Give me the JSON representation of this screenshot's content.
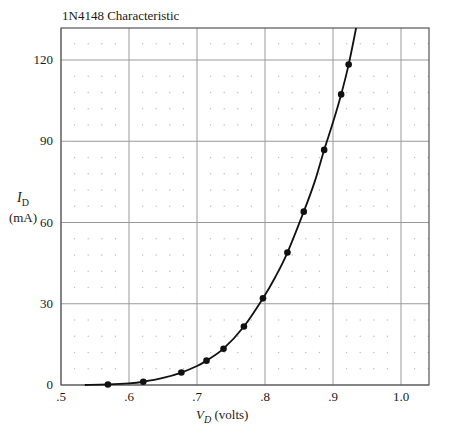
{
  "chart_data": {
    "type": "line",
    "title": "1N4148 Characteristic",
    "xlabel": "V_D (volts)",
    "xlabel_symbol": "V",
    "xlabel_sub": "D",
    "xlabel_unit": "(volts)",
    "ylabel": "I_D (mA)",
    "ylabel_symbol": "I",
    "ylabel_sub": "D",
    "ylabel_unit": "(mA)",
    "xlim": [
      0.5,
      1.04
    ],
    "ylim": [
      0,
      132
    ],
    "x_ticks": [
      0.5,
      0.6,
      0.7,
      0.8,
      0.9,
      1.0
    ],
    "x_tick_labels": [
      ".5",
      ".6",
      ".7",
      ".8",
      ".9",
      "1.0"
    ],
    "y_ticks": [
      0,
      30,
      60,
      90,
      120
    ],
    "y_tick_labels": [
      "0",
      "30",
      "60",
      "90",
      "120"
    ],
    "grid": {
      "major": true,
      "minor_dots": true,
      "minor_x_step": 0.02,
      "minor_y_step": 6
    },
    "legend": null,
    "series": [
      {
        "name": "Measured",
        "marker": "circle",
        "line": false,
        "points": [
          [
            0.569,
            0.2
          ],
          [
            0.621,
            1.2
          ],
          [
            0.677,
            4.6
          ],
          [
            0.714,
            9.0
          ],
          [
            0.739,
            13.4
          ],
          [
            0.769,
            21.6
          ],
          [
            0.797,
            32.0
          ],
          [
            0.833,
            48.9
          ],
          [
            0.857,
            64.0
          ],
          [
            0.887,
            86.8
          ],
          [
            0.912,
            107.3
          ],
          [
            0.923,
            118.3
          ]
        ]
      },
      {
        "name": "Fitted curve",
        "marker": "none",
        "line": true,
        "points": [
          [
            0.535,
            0.0
          ],
          [
            0.569,
            0.2
          ],
          [
            0.6,
            0.6
          ],
          [
            0.621,
            1.2
          ],
          [
            0.65,
            2.6
          ],
          [
            0.677,
            4.6
          ],
          [
            0.7,
            7.0
          ],
          [
            0.714,
            9.0
          ],
          [
            0.739,
            13.4
          ],
          [
            0.769,
            21.6
          ],
          [
            0.797,
            32.0
          ],
          [
            0.815,
            39.8
          ],
          [
            0.833,
            48.9
          ],
          [
            0.857,
            64.0
          ],
          [
            0.873,
            75.0
          ],
          [
            0.887,
            86.8
          ],
          [
            0.9,
            97.0
          ],
          [
            0.912,
            107.3
          ],
          [
            0.923,
            118.3
          ],
          [
            0.934,
            131.8
          ]
        ]
      }
    ],
    "colors": {
      "line": "#111111",
      "marker": "#111111",
      "major_grid": "#9a9a9a",
      "minor_dot": "#bdbdbd",
      "frame": "#555555"
    }
  }
}
